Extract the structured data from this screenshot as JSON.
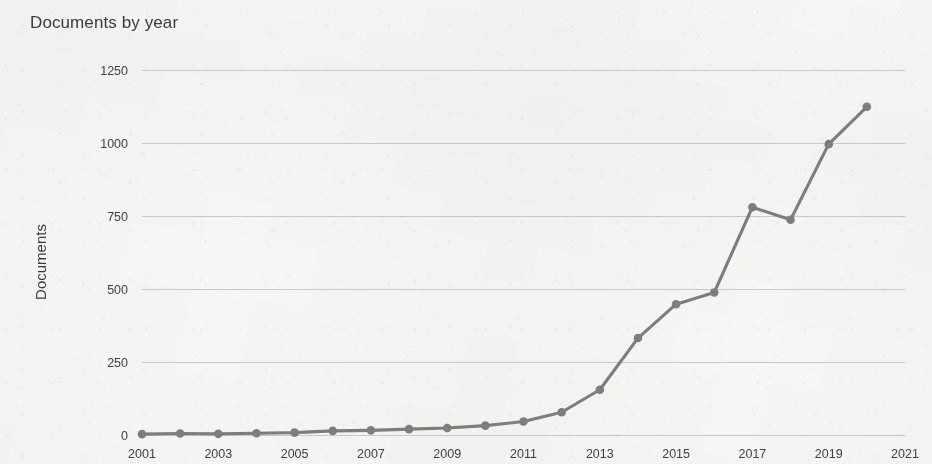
{
  "chart_data": {
    "type": "line",
    "title": "Documents by year",
    "xlabel": "",
    "ylabel": "Documents",
    "x": [
      2001,
      2002,
      2003,
      2004,
      2005,
      2006,
      2007,
      2008,
      2009,
      2010,
      2011,
      2012,
      2013,
      2014,
      2015,
      2016,
      2017,
      2018,
      2019,
      2020
    ],
    "values": [
      3,
      5,
      4,
      6,
      8,
      14,
      16,
      20,
      24,
      32,
      46,
      78,
      155,
      332,
      448,
      488,
      780,
      737,
      996,
      1124
    ],
    "series": [
      {
        "name": "Documents",
        "values": [
          3,
          5,
          4,
          6,
          8,
          14,
          16,
          20,
          24,
          32,
          46,
          78,
          155,
          332,
          448,
          488,
          780,
          737,
          996,
          1124
        ]
      }
    ],
    "xlim": [
      2001,
      2021
    ],
    "ylim": [
      0,
      1250
    ],
    "ytick_labels": [
      "1250",
      "1000",
      "750",
      "500",
      "250",
      "0"
    ],
    "ytick_values": [
      1250,
      1000,
      750,
      500,
      250,
      0
    ],
    "xtick_labels": [
      "2001",
      "2003",
      "2005",
      "2007",
      "2009",
      "2011",
      "2013",
      "2015",
      "2017",
      "2019",
      "2021"
    ],
    "xtick_values": [
      2001,
      2003,
      2005,
      2007,
      2009,
      2011,
      2013,
      2015,
      2017,
      2019,
      2021
    ],
    "grid": true,
    "legend": false,
    "legend_position": "none",
    "line_color": "#7d7d7d",
    "marker_color": "#7d7d7d",
    "grid_color": "#c9c9c9",
    "background_color": "#f7f6f3",
    "text_color": "#3b3b3b"
  }
}
